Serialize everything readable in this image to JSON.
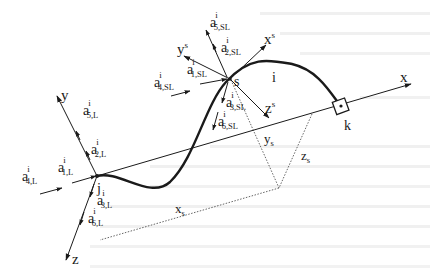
{
  "figure": {
    "type": "3D space-truss / cable element coordinate diagram",
    "global_axes": {
      "x": "x",
      "y": "y",
      "z": "z"
    },
    "local_axes": {
      "x": "x",
      "y": "y",
      "z": "z",
      "superscript": "s"
    },
    "nodes": {
      "j": "j",
      "s": "s",
      "k": "k"
    },
    "element_label": "i",
    "offsets": {
      "x": {
        "base": "x",
        "sub": "s"
      },
      "y": {
        "base": "y",
        "sub": "s"
      },
      "z": {
        "base": "z",
        "sub": "s"
      }
    },
    "end_j_actions": [
      {
        "base": "a",
        "sup": "i",
        "sub": "1,L"
      },
      {
        "base": "a",
        "sup": "i",
        "sub": "2,L"
      },
      {
        "base": "a",
        "sup": "i",
        "sub": "3,L"
      },
      {
        "base": "a",
        "sup": "i",
        "sub": "4,L"
      },
      {
        "base": "a",
        "sup": "i",
        "sub": "5,L"
      },
      {
        "base": "a",
        "sup": "i",
        "sub": "6,L"
      }
    ],
    "end_s_actions": [
      {
        "base": "a",
        "sup": "i",
        "sub": "1,SL"
      },
      {
        "base": "a",
        "sup": "i",
        "sub": "2,SL"
      },
      {
        "base": "a",
        "sup": "i",
        "sub": "3,SL"
      },
      {
        "base": "a",
        "sup": "i",
        "sub": "4,SL"
      },
      {
        "base": "a",
        "sup": "i",
        "sub": "5,SL"
      },
      {
        "base": "a",
        "sup": "i",
        "sub": "6,SL"
      }
    ]
  },
  "colors": {
    "ink": "#1a1a1a",
    "background": "#ffffff",
    "bleed_text": "#e9e9e9"
  }
}
